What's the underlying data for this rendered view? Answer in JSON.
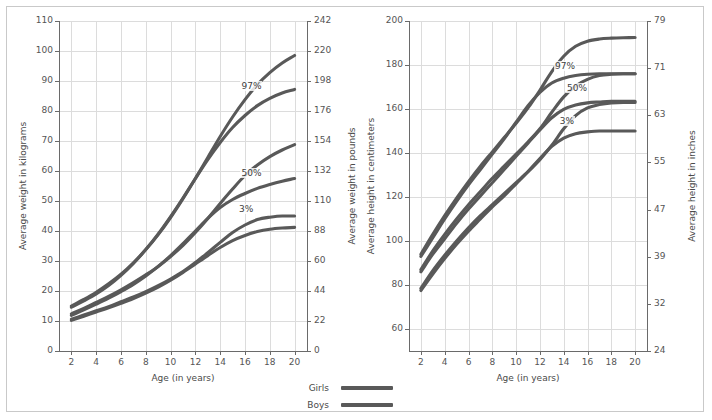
{
  "chart_data": [
    {
      "type": "line",
      "title": "Average weight by age",
      "xlabel": "Age (in years)",
      "ylabel": "Average weight in kilograms",
      "y2label": "Average weight in pounds",
      "xlim": [
        1,
        21
      ],
      "ylim": [
        0,
        110
      ],
      "grid": true,
      "xticks": [
        2,
        4,
        6,
        8,
        10,
        12,
        14,
        16,
        18,
        20
      ],
      "yticks": [
        0,
        10,
        20,
        30,
        40,
        50,
        60,
        70,
        80,
        90,
        100,
        110
      ],
      "y2ticks": [
        0,
        22,
        44,
        60,
        88,
        110,
        132,
        154,
        176,
        198,
        220,
        242
      ],
      "annotations": [
        {
          "text": "97%",
          "x": 16.6,
          "y": 88
        },
        {
          "text": "50%",
          "x": 16.6,
          "y": 59
        },
        {
          "text": "3%",
          "x": 16.4,
          "y": 47
        }
      ],
      "x": [
        2,
        3,
        4,
        5,
        6,
        7,
        8,
        9,
        10,
        11,
        12,
        13,
        14,
        15,
        16,
        17,
        18,
        19,
        20
      ],
      "series": [
        {
          "name": "Boys 97%",
          "sex": "Boys",
          "percentile": "97%",
          "values": [
            15.0,
            17.2,
            19.6,
            22.4,
            25.6,
            29.4,
            33.8,
            38.8,
            44.5,
            50.8,
            57.5,
            64.5,
            71.5,
            78.0,
            83.8,
            88.8,
            92.8,
            96.0,
            98.5
          ]
        },
        {
          "name": "Girls 97%",
          "sex": "Girls",
          "percentile": "97%",
          "values": [
            14.6,
            16.7,
            19.0,
            21.8,
            25.2,
            29.2,
            33.8,
            39.0,
            44.8,
            51.0,
            57.5,
            63.8,
            69.5,
            74.5,
            78.5,
            81.8,
            84.2,
            86.0,
            87.2
          ]
        },
        {
          "name": "Boys 50%",
          "sex": "Boys",
          "percentile": "50%",
          "values": [
            12.4,
            14.2,
            16.2,
            18.2,
            20.4,
            22.8,
            25.4,
            28.2,
            31.5,
            35.2,
            39.5,
            44.2,
            49.2,
            54.0,
            58.5,
            62.0,
            64.8,
            67.0,
            68.8
          ]
        },
        {
          "name": "Girls 50%",
          "sex": "Girls",
          "percentile": "50%",
          "values": [
            11.9,
            13.7,
            15.6,
            17.6,
            19.8,
            22.2,
            25.0,
            28.2,
            31.8,
            35.8,
            40.0,
            44.2,
            47.8,
            50.5,
            52.5,
            54.2,
            55.5,
            56.6,
            57.5
          ]
        },
        {
          "name": "Boys 3%",
          "sex": "Boys",
          "percentile": "3%",
          "values": [
            10.6,
            12.0,
            13.4,
            14.8,
            16.4,
            18.0,
            19.8,
            21.8,
            24.0,
            26.5,
            29.5,
            32.8,
            36.2,
            39.5,
            42.0,
            43.8,
            44.6,
            45.0,
            45.0
          ]
        },
        {
          "name": "Girls 3%",
          "sex": "Girls",
          "percentile": "3%",
          "values": [
            10.2,
            11.6,
            13.0,
            14.4,
            15.9,
            17.5,
            19.3,
            21.3,
            23.6,
            26.2,
            29.0,
            31.8,
            34.5,
            36.8,
            38.5,
            39.8,
            40.6,
            41.0,
            41.2
          ]
        }
      ]
    },
    {
      "type": "line",
      "title": "Average height by age",
      "xlabel": "Age (in years)",
      "ylabel": "Average height in centimeters",
      "y2label": "Average height in inches",
      "xlim": [
        1,
        21
      ],
      "ylim": [
        50,
        200
      ],
      "grid": true,
      "xticks": [
        2,
        4,
        6,
        8,
        10,
        12,
        14,
        16,
        18,
        20
      ],
      "yticks": [
        60,
        80,
        100,
        120,
        140,
        160,
        180,
        200
      ],
      "y2ticks": [
        24,
        32,
        39,
        47,
        55,
        63,
        71,
        79
      ],
      "annotations": [
        {
          "text": "97%",
          "x": 14.2,
          "y": 179
        },
        {
          "text": "50%",
          "x": 15.2,
          "y": 169
        },
        {
          "text": "3%",
          "x": 14.6,
          "y": 154
        }
      ],
      "x": [
        2,
        3,
        4,
        5,
        6,
        7,
        8,
        9,
        10,
        11,
        12,
        13,
        14,
        15,
        16,
        17,
        18,
        19,
        20
      ],
      "series": [
        {
          "name": "Boys 97%",
          "sex": "Boys",
          "percentile": "97%",
          "values": [
            94.0,
            103.0,
            111.5,
            119.5,
            127.0,
            134.0,
            140.5,
            147.0,
            153.5,
            160.5,
            168.5,
            177.0,
            184.0,
            188.5,
            190.8,
            191.8,
            192.2,
            192.4,
            192.5
          ]
        },
        {
          "name": "Girls 97%",
          "sex": "Girls",
          "percentile": "97%",
          "values": [
            93.0,
            101.5,
            110.0,
            118.0,
            125.5,
            132.5,
            139.5,
            146.5,
            154.0,
            161.5,
            167.5,
            171.8,
            174.0,
            175.2,
            175.8,
            176.0,
            176.0,
            176.0,
            176.0
          ]
        },
        {
          "name": "Boys 50%",
          "sex": "Boys",
          "percentile": "50%",
          "values": [
            87.0,
            95.5,
            103.0,
            110.0,
            116.5,
            122.5,
            128.5,
            134.0,
            139.5,
            145.0,
            151.0,
            158.5,
            165.5,
            170.5,
            173.5,
            175.2,
            175.8,
            176.0,
            176.0
          ]
        },
        {
          "name": "Girls 50%",
          "sex": "Girls",
          "percentile": "50%",
          "values": [
            86.0,
            94.0,
            101.0,
            108.0,
            114.5,
            120.5,
            126.5,
            132.5,
            138.5,
            144.5,
            150.5,
            156.0,
            159.8,
            161.8,
            162.8,
            163.2,
            163.5,
            163.5,
            163.5
          ]
        },
        {
          "name": "Boys 3%",
          "sex": "Boys",
          "percentile": "3%",
          "values": [
            78.5,
            86.5,
            93.5,
            100.0,
            106.0,
            111.5,
            116.5,
            121.5,
            126.5,
            131.5,
            137.0,
            143.5,
            151.0,
            157.0,
            160.5,
            162.0,
            162.8,
            163.0,
            163.0
          ]
        },
        {
          "name": "Girls 3%",
          "sex": "Girls",
          "percentile": "3%",
          "values": [
            77.5,
            85.0,
            92.0,
            98.5,
            104.5,
            110.0,
            115.5,
            120.5,
            126.0,
            131.5,
            137.5,
            143.0,
            146.8,
            148.8,
            149.6,
            150.0,
            150.0,
            150.0,
            150.0
          ]
        }
      ]
    }
  ],
  "legend": {
    "position": "bottom-center",
    "entries": [
      {
        "label": "Girls",
        "color": "#595959"
      },
      {
        "label": "Boys",
        "color": "#595959"
      }
    ]
  },
  "style": {
    "curve_color": "#595959",
    "grid_color": "#dcdcdc",
    "axis_color": "#6a6a6a",
    "text_color": "#4a4a4a",
    "background": "#ffffff",
    "border_color": "#c9c9c9"
  }
}
